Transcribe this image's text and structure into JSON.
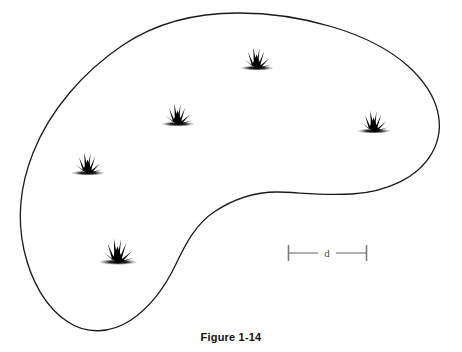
{
  "figure": {
    "caption": "Figure 1-14",
    "background_color": "#ffffff",
    "outline_color": "#1a1a1a",
    "outline_width": 1.3,
    "marker_color": "#000000",
    "scalebar_color": "#7a7a7a"
  },
  "region": {
    "name": "habitat-region-outline",
    "kind": "closed-freeform-blob",
    "extents": {
      "left_x": 22,
      "right_x": 441,
      "top_y": 13,
      "bottom_y": 330
    },
    "path": "M 238 13 C 300 13 370 32 408 66 C 441 96 446 128 432 153 C 418 178 386 192 352 194 C 320 196 296 192 277 192 C 252 192 232 200 214 212 C 196 224 186 243 176 264 C 166 285 152 306 131 320 C 110 334 86 334 68 322 C 46 308 31 281 24 250 C 17 219 20 186 33 153 C 50 110 83 72 123 45 C 159 21 200 13 238 13 Z"
  },
  "markers": {
    "name": "grass-tuft-markers",
    "count": 5,
    "items": [
      {
        "id": "grass-tuft-1",
        "x": 257,
        "y": 68,
        "scale": 1.0
      },
      {
        "id": "grass-tuft-2",
        "x": 178,
        "y": 124,
        "scale": 1.0
      },
      {
        "id": "grass-tuft-3",
        "x": 374,
        "y": 131,
        "scale": 1.0
      },
      {
        "id": "grass-tuft-4",
        "x": 88,
        "y": 173,
        "scale": 1.0
      },
      {
        "id": "grass-tuft-5",
        "x": 118,
        "y": 262,
        "scale": 1.15
      }
    ]
  },
  "scalebar": {
    "name": "distance-scale-bar",
    "label": "d",
    "x_start": 288,
    "x_end": 366,
    "y": 253,
    "cap_half_height": 8
  }
}
